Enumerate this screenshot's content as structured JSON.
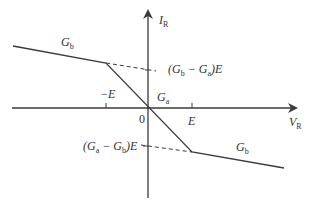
{
  "diagram": {
    "type": "piecewise-linear I-V characteristic",
    "axes": {
      "x_label": "V",
      "x_label_sub": "R",
      "y_label": "I",
      "y_label_sub": "R",
      "origin_label": "0"
    },
    "ticks": {
      "neg_E": "−E",
      "pos_E": "E"
    },
    "segments": {
      "left_slope": {
        "label": "G",
        "sub": "b"
      },
      "middle_slope": {
        "label": "G",
        "sub": "a"
      },
      "right_slope": {
        "label": "G",
        "sub": "b"
      }
    },
    "annotations": {
      "upper_intercept": {
        "open": "(G",
        "s1": "b",
        "minus": " − G",
        "s2": "a",
        "close": ")E"
      },
      "lower_intercept": {
        "open": "(G",
        "s1": "a",
        "minus": " − G",
        "s2": "b",
        "close": ")E"
      }
    },
    "colors": {
      "line": "#3a3a3a",
      "text": "#333333"
    }
  }
}
